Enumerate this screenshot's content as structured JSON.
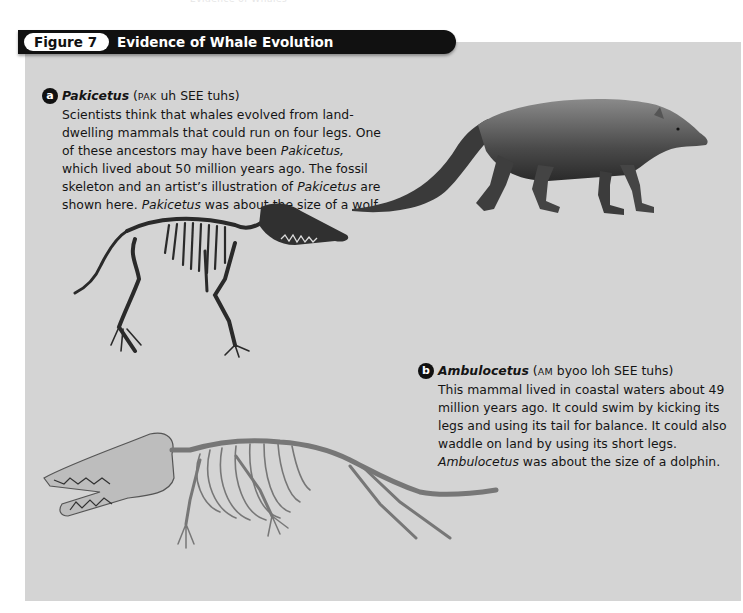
{
  "running_head": "Evidence of Whales",
  "figure": {
    "label": "Figure 7",
    "title": "Evidence of Whale Evolution"
  },
  "sections": [
    {
      "badge": "a",
      "species": "Pakicetus",
      "pron_open": "(",
      "pron_smallcaps": "PAK",
      "pron_rest": " uh SEE tuhs)",
      "text_1": "Scientists think that whales evolved from land-dwelling mammals that could run on four legs. One of these ancestors may have been ",
      "italic_1": "Pakicetus,",
      "text_2": " which lived about 50 million years ago. The fossil skeleton and an artist’s illustration of ",
      "italic_2": "Pakicetus",
      "text_3": " are shown here. ",
      "italic_3": "Pakicetus",
      "text_4": " was about the size of a wolf."
    },
    {
      "badge": "b",
      "species": "Ambulocetus",
      "pron_open": "(",
      "pron_smallcaps": "AM",
      "pron_rest": " byoo loh SEE tuhs)",
      "text_1": "This mammal lived in coastal waters about 49 million years ago. It could swim by kicking its legs and using its tail for balance. It could also waddle on land by using its short legs. ",
      "italic_1": "Ambulocetus",
      "text_2": " was about the size of a dolphin."
    }
  ],
  "images": {
    "pakicetus_skeleton": "Pakicetus fossil skeleton",
    "pakicetus_illustration": "Artist's illustration of Pakicetus",
    "ambulocetus_skeleton": "Ambulocetus fossil skeleton"
  }
}
